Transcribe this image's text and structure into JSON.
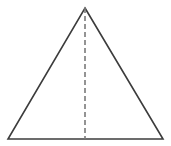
{
  "figure": {
    "title": "Isosceles triangle with dashed altitude",
    "canvas": {
      "width": 171,
      "height": 146,
      "background_color": "#ffffff"
    },
    "shapes": {
      "triangle": {
        "label": "triangle-outline",
        "points": "85,8 163,139 8,139",
        "vertices": {
          "apex": {
            "label": "apex-vertex",
            "x": 85,
            "y": 8
          },
          "bottom_right": {
            "label": "bottom-right-vertex",
            "x": 163,
            "y": 139
          },
          "bottom_left": {
            "label": "bottom-left-vertex",
            "x": 8,
            "y": 139
          }
        },
        "stroke_color": "#3c3c3c",
        "stroke_width": 1.6,
        "fill": "none"
      },
      "altitude": {
        "label": "dashed-altitude-line",
        "x1": 85,
        "y1": 8,
        "x2": 85,
        "y2": 139,
        "stroke_color": "#7a7a7a",
        "stroke_width": 1.6,
        "dash_pattern": "5 3"
      }
    }
  }
}
